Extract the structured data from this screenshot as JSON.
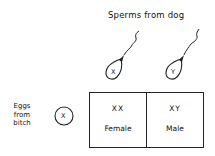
{
  "diagram": {
    "sperm_header": "Sperms from dog",
    "egg_header_lines": [
      "Eggs",
      "from",
      "bitch"
    ],
    "sperm": [
      {
        "chromosome": "X"
      },
      {
        "chromosome": "Y"
      }
    ],
    "egg": {
      "chromosome": "X"
    },
    "offspring": [
      {
        "genotype": "XX",
        "sex": "Female"
      },
      {
        "genotype": "XY",
        "sex": "Male"
      }
    ]
  }
}
